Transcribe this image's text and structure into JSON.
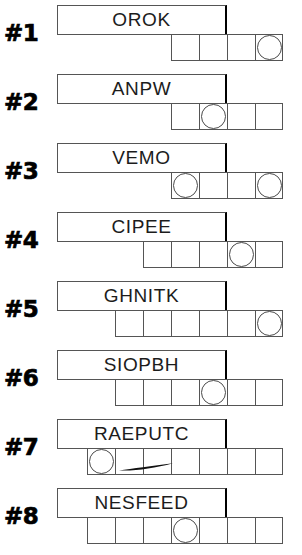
{
  "worksheet": {
    "title": "Word Unscramble Circle Worksheet",
    "row_count": 8,
    "colors": {
      "ink": "#1a1a1a",
      "line": "#555555",
      "accent": "#000000",
      "paper": "#ffffff"
    }
  },
  "rows": [
    {
      "number": "#1",
      "word": "OROK",
      "cell_count": 4,
      "circled_cells": [
        4
      ],
      "word_box": {
        "left": 57,
        "width": 170
      },
      "strip": {
        "left": 171
      },
      "has_dash": false
    },
    {
      "number": "#2",
      "word": "ANPW",
      "cell_count": 4,
      "circled_cells": [
        2
      ],
      "word_box": {
        "left": 57,
        "width": 170
      },
      "strip": {
        "left": 171
      },
      "has_dash": false
    },
    {
      "number": "#3",
      "word": "VEMO",
      "cell_count": 4,
      "circled_cells": [
        1,
        4
      ],
      "word_box": {
        "left": 57,
        "width": 170
      },
      "strip": {
        "left": 171
      },
      "has_dash": false
    },
    {
      "number": "#4",
      "word": "CIPEE",
      "cell_count": 5,
      "circled_cells": [
        4
      ],
      "word_box": {
        "left": 57,
        "width": 170
      },
      "strip": {
        "left": 143
      },
      "has_dash": false
    },
    {
      "number": "#5",
      "word": "GHNITK",
      "cell_count": 6,
      "circled_cells": [
        6
      ],
      "word_box": {
        "left": 57,
        "width": 170
      },
      "strip": {
        "left": 115
      },
      "has_dash": false
    },
    {
      "number": "#6",
      "word": "SIOPBH",
      "cell_count": 6,
      "circled_cells": [
        4
      ],
      "word_box": {
        "left": 57,
        "width": 170
      },
      "strip": {
        "left": 115
      },
      "has_dash": false
    },
    {
      "number": "#7",
      "word": "RAEPUTC",
      "cell_count": 7,
      "circled_cells": [
        1
      ],
      "word_box": {
        "left": 57,
        "width": 170
      },
      "strip": {
        "left": 87
      },
      "has_dash": true,
      "dash": {
        "left": 118,
        "top": 48,
        "width": 56
      }
    },
    {
      "number": "#8",
      "word": "NESFEED",
      "cell_count": 7,
      "circled_cells": [
        4
      ],
      "word_box": {
        "left": 57,
        "width": 170
      },
      "strip": {
        "left": 87
      },
      "has_dash": false
    }
  ],
  "layout": {
    "row_tops": [
      0,
      69,
      138,
      207,
      276,
      345,
      414,
      483
    ],
    "cell_width": 28,
    "cell_height": 27
  }
}
